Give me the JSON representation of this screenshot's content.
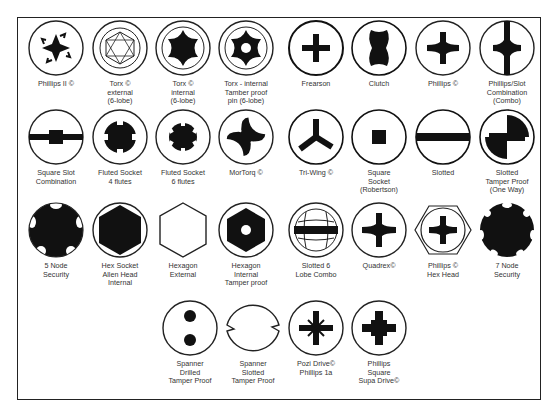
{
  "items": [
    {
      "id": "phillips-ii",
      "label": "Phillips II ©"
    },
    {
      "id": "torx-external",
      "label": "Torx ©\nexternal\n(6-lobe)"
    },
    {
      "id": "torx-internal",
      "label": "Torx ©\ninternal\n(6-lobe)"
    },
    {
      "id": "torx-tamper",
      "label": "Torx - internal\nTamber proof\npin (6-lobe)"
    },
    {
      "id": "frearson",
      "label": "Frearson"
    },
    {
      "id": "clutch",
      "label": "Clutch"
    },
    {
      "id": "phillips",
      "label": "Phillips ©"
    },
    {
      "id": "phillips-slot",
      "label": "Phillips/Slot\nCombination\n(Combo)"
    },
    {
      "id": "square-slot",
      "label": "Square Slot\nCombination"
    },
    {
      "id": "fluted-4",
      "label": "Fluted Socket\n4 flutes"
    },
    {
      "id": "fluted-6",
      "label": "Fluted Socket\n6 flutes"
    },
    {
      "id": "mortorq",
      "label": "MorTorq ©"
    },
    {
      "id": "tri-wing",
      "label": "Tri-Wing ©"
    },
    {
      "id": "square-socket",
      "label": "Square\nSocket\n(Robertson)"
    },
    {
      "id": "slotted",
      "label": "Slotted"
    },
    {
      "id": "slotted-tamper",
      "label": "Slotted\nTamper Proof\n(One Way)"
    },
    {
      "id": "5-node",
      "label": "5 Node\nSecurity"
    },
    {
      "id": "hex-socket",
      "label": "Hex Socket\nAllen Head\nInternal"
    },
    {
      "id": "hexagon-external",
      "label": "Hexagon\nExternal"
    },
    {
      "id": "hexagon-internal-tamper",
      "label": "Hexagon\nInternal\nTamper proof"
    },
    {
      "id": "slotted-6-lobe",
      "label": "Slotted 6\nLobe Combo"
    },
    {
      "id": "quadrex",
      "label": "Quadrex©"
    },
    {
      "id": "phillips-hex",
      "label": "Phillips ©\nHex Head"
    },
    {
      "id": "7-node",
      "label": "7 Node\nSecurity"
    },
    {
      "id": "spanner-drilled",
      "label": "Spanner\nDrilled\nTamper Proof"
    },
    {
      "id": "spanner-slotted",
      "label": "Spanner\nSlotted\nTamper Proof"
    },
    {
      "id": "pozi-drive",
      "label": "Pozi Drive©\nPhillips 1a"
    },
    {
      "id": "phillips-square",
      "label": "Phillips\nSquare\nSupa Drive©"
    }
  ],
  "colors": {
    "ink": "#111111",
    "line": "#222222",
    "text": "#333333",
    "background": "#ffffff"
  }
}
